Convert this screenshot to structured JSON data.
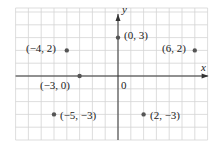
{
  "diagram": {
    "type": "coordinate-plane",
    "origin_label": "0",
    "x_axis_label": "x",
    "y_axis_label": "y",
    "x_range": [
      -8,
      7
    ],
    "y_range": [
      -5,
      5
    ],
    "colors": {
      "grid": "#d4d4d4",
      "axis": "#333333",
      "point": "#555555",
      "text": "#222222"
    },
    "points": [
      {
        "x": 0,
        "y": 3,
        "label": "(0, 3)"
      },
      {
        "x": -4,
        "y": 2,
        "label": "(−4, 2)"
      },
      {
        "x": 6,
        "y": 2,
        "label": "(6, 2)"
      },
      {
        "x": -3,
        "y": 0,
        "label": "(−3, 0)"
      },
      {
        "x": -5,
        "y": -3,
        "label": "(−5, −3)"
      },
      {
        "x": 2,
        "y": -3,
        "label": "(2, −3)"
      }
    ]
  }
}
